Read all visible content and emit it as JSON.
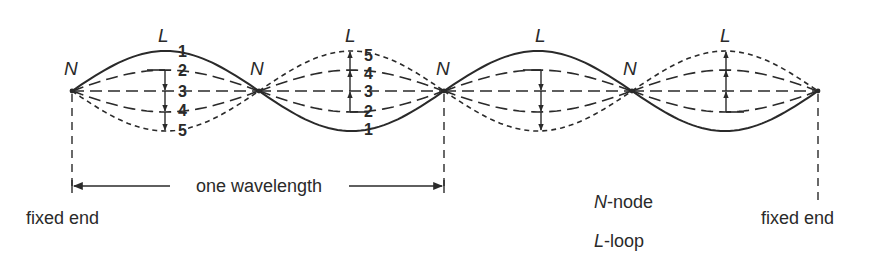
{
  "diagram": {
    "colors": {
      "ink": "#2a2a2a",
      "background": "#ffffff"
    },
    "axis_y": 91,
    "nodes": [
      {
        "label": "N",
        "x": 72
      },
      {
        "label": "N",
        "x": 259
      },
      {
        "label": "N",
        "x": 444
      },
      {
        "label": "N",
        "x": 632
      },
      {
        "label": "",
        "x": 818
      }
    ],
    "loops": [
      {
        "label": "L",
        "x_start": 72,
        "x_end": 259,
        "arrow_x": 165,
        "arrow_direction": "down",
        "numbers_x": 183,
        "positions": [
          {
            "n": "1",
            "y": 55
          },
          {
            "n": "2",
            "y": 74
          },
          {
            "n": "3",
            "y": 96
          },
          {
            "n": "4",
            "y": 115
          },
          {
            "n": "5",
            "y": 135
          }
        ]
      },
      {
        "label": "L",
        "x_start": 259,
        "x_end": 444,
        "arrow_x": 350,
        "arrow_direction": "up",
        "numbers_x": 370,
        "positions": [
          {
            "n": "5",
            "y": 60
          },
          {
            "n": "4",
            "y": 78
          },
          {
            "n": "3",
            "y": 96
          },
          {
            "n": "2",
            "y": 116
          },
          {
            "n": "1",
            "y": 134
          }
        ]
      },
      {
        "label": "L",
        "x_start": 444,
        "x_end": 632,
        "arrow_x": 541,
        "arrow_direction": "down",
        "numbers_x": null,
        "positions": []
      },
      {
        "label": "L",
        "x_start": 632,
        "x_end": 818,
        "arrow_x": 726,
        "arrow_direction": "up",
        "numbers_x": null,
        "positions": []
      }
    ],
    "wavelength": {
      "label": "one wavelength",
      "x_start": 72,
      "x_end": 444,
      "y": 186
    },
    "fixed_ends": [
      {
        "label": "fixed end",
        "x": 30,
        "y": 224
      },
      {
        "label": "fixed end",
        "x": 786,
        "y": 224
      }
    ],
    "legend": [
      {
        "symbol": "N",
        "text": "-node"
      },
      {
        "symbol": "L",
        "text": "-loop"
      }
    ]
  }
}
